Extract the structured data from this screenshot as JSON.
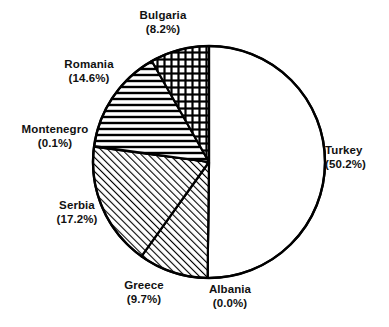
{
  "chart_data": {
    "type": "pie",
    "title": "",
    "subtitle": "",
    "xlabel": "",
    "ylabel": "",
    "legend_position": "none",
    "grid": false,
    "units": "percent",
    "value_format": "(#.#%)",
    "start_angle_deg": 0,
    "direction": "clockwise",
    "categories": [
      "Turkey",
      "Albania",
      "Greece",
      "Serbia",
      "Montenegro",
      "Romania",
      "Bulgaria"
    ],
    "values": [
      50.2,
      0.0,
      9.7,
      17.2,
      0.1,
      14.6,
      8.2
    ],
    "slices": [
      {
        "name": "Turkey",
        "value": 50.2,
        "value_text": "(50.2%)",
        "fill": "none",
        "pattern": "solid-white",
        "label_position": "right"
      },
      {
        "name": "Albania",
        "value": 0.0,
        "value_text": "(0.0%)",
        "fill": "none",
        "pattern": "solid-white",
        "label_position": "bottom"
      },
      {
        "name": "Greece",
        "value": 9.7,
        "value_text": "(9.7%)",
        "fill": "hatch",
        "pattern": "diagonal-up",
        "label_position": "bottom-left"
      },
      {
        "name": "Serbia",
        "value": 17.2,
        "value_text": "(17.2%)",
        "fill": "hatch",
        "pattern": "diagonal-up",
        "label_position": "left-bottom"
      },
      {
        "name": "Montenegro",
        "value": 0.1,
        "value_text": "(0.1%)",
        "fill": "none",
        "pattern": "solid-white",
        "label_position": "left"
      },
      {
        "name": "Romania",
        "value": 14.6,
        "value_text": "(14.6%)",
        "fill": "hatch",
        "pattern": "horizontal-lines",
        "label_position": "left-top"
      },
      {
        "name": "Bulgaria",
        "value": 8.2,
        "value_text": "(8.2%)",
        "fill": "hatch",
        "pattern": "cross-hatch",
        "label_position": "top"
      }
    ],
    "colors": {
      "background": "#ffffff",
      "stroke": "#000000",
      "text": "#111111"
    },
    "geometry": {
      "center_x": 209,
      "center_y": 162,
      "radius": 116
    }
  },
  "labels": {
    "turkey": {
      "name": "Turkey",
      "pct": "(50.2%)"
    },
    "albania": {
      "name": "Albania",
      "pct": "(0.0%)"
    },
    "greece": {
      "name": "Greece",
      "pct": "(9.7%)"
    },
    "serbia": {
      "name": "Serbia",
      "pct": "(17.2%)"
    },
    "montenegro": {
      "name": "Montenegro",
      "pct": "(0.1%)"
    },
    "romania": {
      "name": "Romania",
      "pct": "(14.6%)"
    },
    "bulgaria": {
      "name": "Bulgaria",
      "pct": "(8.2%)"
    }
  }
}
